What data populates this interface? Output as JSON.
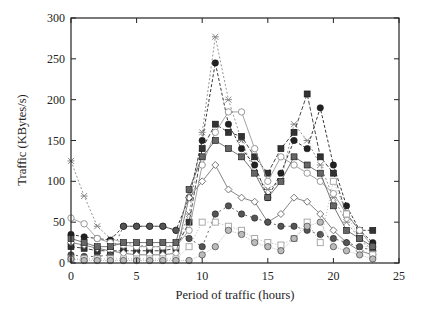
{
  "chart_data": {
    "type": "line",
    "title": "",
    "xlabel": "Period of traffic (hours)",
    "ylabel": "Traffic (KBytes/s)",
    "xlim": [
      0,
      25
    ],
    "ylim": [
      0,
      300
    ],
    "xticks": [
      0,
      5,
      10,
      15,
      20,
      25
    ],
    "yticks": [
      0,
      50,
      100,
      150,
      200,
      250,
      300
    ],
    "grid": false,
    "legend": "none",
    "x": [
      0,
      1,
      2,
      3,
      4,
      5,
      6,
      7,
      8,
      9,
      10,
      11,
      12,
      13,
      14,
      15,
      16,
      17,
      18,
      19,
      20,
      21,
      22,
      23
    ],
    "series": [
      {
        "name": "s1-star",
        "marker": "star",
        "color": "#888888",
        "dash": "2,2",
        "values": [
          125,
          82,
          45,
          30,
          25,
          22,
          20,
          20,
          22,
          60,
          160,
          277,
          200,
          150,
          110,
          90,
          100,
          170,
          150,
          120,
          80,
          50,
          30,
          15
        ]
      },
      {
        "name": "s2-filled-circle",
        "marker": "circle",
        "color": "#222222",
        "dash": "3,2",
        "values": [
          35,
          32,
          30,
          28,
          45,
          45,
          45,
          45,
          40,
          80,
          150,
          245,
          170,
          140,
          120,
          80,
          110,
          150,
          140,
          190,
          120,
          70,
          40,
          25
        ]
      },
      {
        "name": "s3-filled-square",
        "marker": "square",
        "color": "#333333",
        "dash": "4,2",
        "values": [
          20,
          18,
          15,
          15,
          15,
          15,
          15,
          15,
          18,
          50,
          140,
          170,
          160,
          155,
          130,
          110,
          140,
          160,
          207,
          130,
          110,
          60,
          40,
          40
        ]
      },
      {
        "name": "s4-open-circle",
        "marker": "open-circle",
        "color": "#999999",
        "dash": "",
        "values": [
          55,
          48,
          30,
          25,
          22,
          20,
          20,
          20,
          20,
          40,
          120,
          160,
          185,
          185,
          140,
          100,
          130,
          120,
          110,
          100,
          85,
          60,
          40,
          20
        ]
      },
      {
        "name": "s5-open-diamond",
        "marker": "diamond",
        "color": "#777777",
        "dash": "",
        "values": [
          25,
          22,
          18,
          15,
          12,
          10,
          10,
          10,
          12,
          80,
          100,
          120,
          90,
          80,
          75,
          50,
          60,
          80,
          75,
          60,
          40,
          25,
          15,
          10
        ]
      },
      {
        "name": "s6-half-circle",
        "marker": "circle",
        "color": "#555555",
        "dash": "2,3",
        "values": [
          10,
          8,
          8,
          10,
          45,
          45,
          45,
          45,
          40,
          30,
          20,
          60,
          70,
          60,
          55,
          50,
          45,
          45,
          40,
          35,
          30,
          25,
          20,
          15
        ]
      },
      {
        "name": "s7-open-square",
        "marker": "open-square",
        "color": "#aaaaaa",
        "dash": "1,2",
        "values": [
          5,
          5,
          5,
          5,
          5,
          5,
          5,
          5,
          5,
          20,
          50,
          50,
          45,
          40,
          30,
          25,
          22,
          30,
          50,
          25,
          100,
          60,
          30,
          10
        ]
      },
      {
        "name": "s8-light",
        "marker": "circle",
        "color": "#bbbbbb",
        "dash": "1,1",
        "values": [
          5,
          3,
          3,
          3,
          3,
          3,
          3,
          3,
          3,
          3,
          10,
          20,
          40,
          35,
          25,
          20,
          15,
          30,
          45,
          50,
          20,
          15,
          10,
          5
        ]
      },
      {
        "name": "s9-mid",
        "marker": "square",
        "color": "#666666",
        "dash": "",
        "values": [
          30,
          25,
          20,
          20,
          25,
          25,
          25,
          25,
          25,
          90,
          130,
          150,
          140,
          130,
          110,
          80,
          100,
          130,
          120,
          110,
          70,
          40,
          30,
          20
        ]
      }
    ]
  }
}
